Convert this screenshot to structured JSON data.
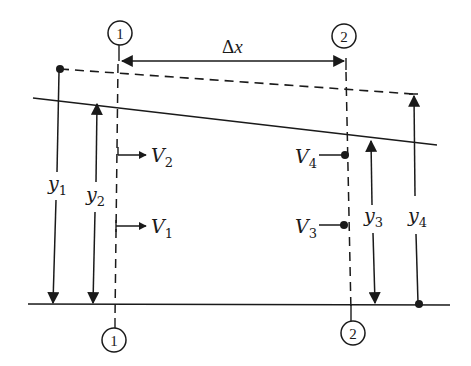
{
  "diagram": {
    "colors": {
      "stroke": "#1a1a1a",
      "background": "#ffffff"
    },
    "sections": [
      {
        "id": "1",
        "label": "1"
      },
      {
        "id": "2",
        "label": "2"
      }
    ],
    "distance_label": {
      "delta": "Δ",
      "var": "x"
    },
    "lines": {
      "energy_line": "dashed",
      "water_surface": "solid",
      "channel_bottom": "solid"
    },
    "depths": [
      {
        "name": "y1",
        "base": "y",
        "sub": "1"
      },
      {
        "name": "y2",
        "base": "y",
        "sub": "2"
      },
      {
        "name": "y3",
        "base": "y",
        "sub": "3"
      },
      {
        "name": "y4",
        "base": "y",
        "sub": "4"
      }
    ],
    "velocities": [
      {
        "name": "V1",
        "base": "V",
        "sub": "1"
      },
      {
        "name": "V2",
        "base": "V",
        "sub": "2"
      },
      {
        "name": "V3",
        "base": "V",
        "sub": "3"
      },
      {
        "name": "V4",
        "base": "V",
        "sub": "4"
      }
    ]
  }
}
